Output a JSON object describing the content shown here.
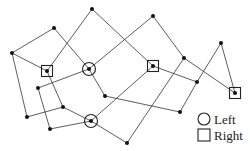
{
  "diagram": {
    "type": "graph",
    "nodes": [
      {
        "id": "A",
        "x": 92,
        "y": 9,
        "kind": "plain"
      },
      {
        "id": "B",
        "x": 153,
        "y": 16,
        "kind": "plain"
      },
      {
        "id": "C",
        "x": 54,
        "y": 28,
        "kind": "plain"
      },
      {
        "id": "D",
        "x": 12,
        "y": 53,
        "kind": "plain"
      },
      {
        "id": "E",
        "x": 47,
        "y": 71,
        "kind": "right"
      },
      {
        "id": "F",
        "x": 89,
        "y": 69,
        "kind": "left"
      },
      {
        "id": "G",
        "x": 153,
        "y": 66,
        "kind": "right"
      },
      {
        "id": "H",
        "x": 184,
        "y": 58,
        "kind": "plain"
      },
      {
        "id": "I",
        "x": 221,
        "y": 43,
        "kind": "plain"
      },
      {
        "id": "J",
        "x": 197,
        "y": 82,
        "kind": "plain"
      },
      {
        "id": "K",
        "x": 235,
        "y": 93,
        "kind": "right"
      },
      {
        "id": "L",
        "x": 38,
        "y": 88,
        "kind": "plain"
      },
      {
        "id": "M",
        "x": 105,
        "y": 96,
        "kind": "plain"
      },
      {
        "id": "N",
        "x": 63,
        "y": 107,
        "kind": "plain"
      },
      {
        "id": "O",
        "x": 27,
        "y": 117,
        "kind": "plain"
      },
      {
        "id": "P",
        "x": 91,
        "y": 121,
        "kind": "left"
      },
      {
        "id": "Q",
        "x": 180,
        "y": 112,
        "kind": "plain"
      },
      {
        "id": "R",
        "x": 50,
        "y": 129,
        "kind": "plain"
      },
      {
        "id": "S",
        "x": 127,
        "y": 143,
        "kind": "plain"
      }
    ],
    "edges": [
      [
        "D",
        "C"
      ],
      [
        "C",
        "F"
      ],
      [
        "D",
        "E"
      ],
      [
        "D",
        "O"
      ],
      [
        "E",
        "A"
      ],
      [
        "A",
        "G"
      ],
      [
        "F",
        "B"
      ],
      [
        "B",
        "H"
      ],
      [
        "G",
        "J"
      ],
      [
        "H",
        "K"
      ],
      [
        "I",
        "K"
      ],
      [
        "I",
        "J"
      ],
      [
        "J",
        "Q"
      ],
      [
        "H",
        "S"
      ],
      [
        "E",
        "N"
      ],
      [
        "F",
        "L"
      ],
      [
        "F",
        "M"
      ],
      [
        "L",
        "R"
      ],
      [
        "O",
        "N"
      ],
      [
        "N",
        "P"
      ],
      [
        "R",
        "P"
      ],
      [
        "P",
        "G"
      ],
      [
        "P",
        "S"
      ],
      [
        "M",
        "Q"
      ]
    ]
  },
  "legend": {
    "items": [
      {
        "symbol": "circle",
        "label": "Left"
      },
      {
        "symbol": "square",
        "label": "Right"
      }
    ]
  }
}
